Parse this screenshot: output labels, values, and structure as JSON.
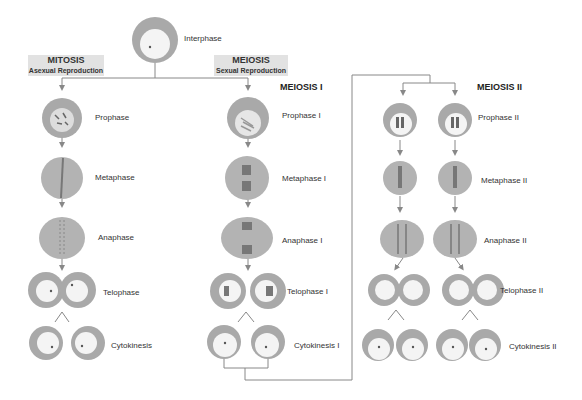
{
  "colors": {
    "cell_outer": "#a9a9a9",
    "cell_inner": "#f4f4f4",
    "line": "#888888",
    "chromosome": "#6a6a6a",
    "tag_bg": "#e2e2e2"
  },
  "start": {
    "label": "Interphase"
  },
  "mitosis": {
    "tag": {
      "title": "MITOSIS",
      "subtitle": "Asexual Reproduction"
    },
    "stages": [
      "Prophase",
      "Metaphase",
      "Anaphase",
      "Telophase",
      "Cytokinesis"
    ]
  },
  "meiosis": {
    "tag": {
      "title": "MEIOSIS",
      "subtitle": "Sexual Reproduction"
    },
    "meiosis1": {
      "heading": "MEIOSIS I",
      "stages": [
        "Prophase  I",
        "Metaphase I",
        "Anaphase I",
        "Telophase I",
        "Cytokinesis I"
      ]
    },
    "meiosis2": {
      "heading": "MEIOSIS II",
      "stages": [
        "Prophase  II",
        "Metaphase II",
        "Anaphase II",
        "Telophase II",
        "Cytokinesis II"
      ]
    }
  }
}
